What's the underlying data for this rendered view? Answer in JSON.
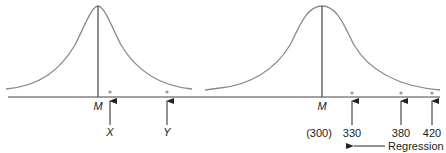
{
  "diagram": {
    "left_panel": {
      "mean_label": "M",
      "points": [
        {
          "label": "X"
        },
        {
          "label": "Y"
        }
      ]
    },
    "right_panel": {
      "mean_label": "M",
      "mean_value": "(300)",
      "points": [
        {
          "label": "330"
        },
        {
          "label": "380"
        },
        {
          "label": "420"
        }
      ],
      "arrow_label": "Regression"
    },
    "colors": {
      "curve": "#8a8a8a",
      "axis": "#444444",
      "dot": "#999999",
      "text": "#222222"
    }
  }
}
